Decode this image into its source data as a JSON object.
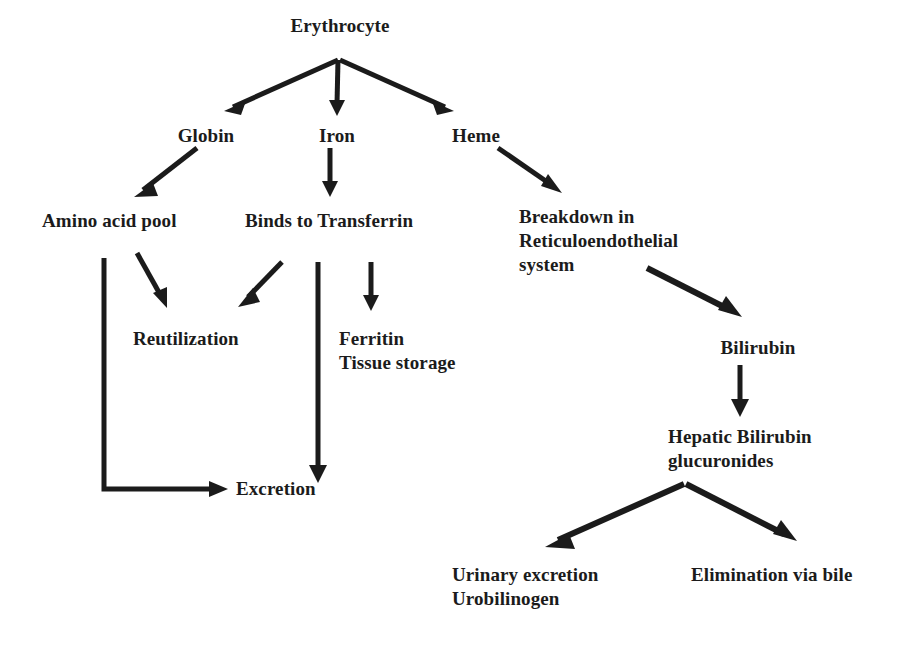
{
  "diagram": {
    "background_color": "#ffffff",
    "ink_color": "#1b1b1b",
    "nodes": [
      {
        "id": "erythrocyte",
        "label": "Erythrocyte",
        "x": 340,
        "y": 14,
        "align": "center"
      },
      {
        "id": "globin",
        "label": "Globin",
        "x": 206,
        "y": 124,
        "align": "center"
      },
      {
        "id": "iron",
        "label": "Iron",
        "x": 337,
        "y": 124,
        "align": "center"
      },
      {
        "id": "heme",
        "label": "Heme",
        "x": 476,
        "y": 124,
        "align": "center"
      },
      {
        "id": "amino-acid-pool",
        "label": "Amino acid pool",
        "x": 42,
        "y": 209,
        "align": "left"
      },
      {
        "id": "binds-to-transferrin",
        "label": "Binds to Transferrin",
        "x": 245,
        "y": 209,
        "align": "left"
      },
      {
        "id": "breakdown-res",
        "label": "Breakdown in\nReticuloendothelial\nsystem",
        "x": 519,
        "y": 205,
        "align": "left"
      },
      {
        "id": "reutilization",
        "label": "Reutilization",
        "x": 133,
        "y": 327,
        "align": "left"
      },
      {
        "id": "ferritin-tissue-storage",
        "label": "Ferritin\nTissue storage",
        "x": 339,
        "y": 327,
        "align": "left"
      },
      {
        "id": "bilirubin",
        "label": "Bilirubin",
        "x": 758,
        "y": 336,
        "align": "center"
      },
      {
        "id": "excretion",
        "label": "Excretion",
        "x": 236,
        "y": 477,
        "align": "left"
      },
      {
        "id": "hepatic-bilirubin-glucuronides",
        "label": "Hepatic Bilirubin\nglucuronides",
        "x": 668,
        "y": 425,
        "align": "left"
      },
      {
        "id": "urinary-excretion-urobilinogen",
        "label": "Urinary excretion\nUrobilinogen",
        "x": 452,
        "y": 563,
        "align": "left"
      },
      {
        "id": "elimination-via-bile",
        "label": "Elimination via bile",
        "x": 691,
        "y": 563,
        "align": "left"
      }
    ],
    "edges": [
      {
        "id": "erythrocyte-to-globin",
        "from": "erythrocyte",
        "to": "globin",
        "kind": "arrow"
      },
      {
        "id": "erythrocyte-to-iron",
        "from": "erythrocyte",
        "to": "iron",
        "kind": "arrow"
      },
      {
        "id": "erythrocyte-to-heme",
        "from": "erythrocyte",
        "to": "heme",
        "kind": "arrow"
      },
      {
        "id": "globin-to-amino-acid-pool",
        "from": "globin",
        "to": "amino-acid-pool",
        "kind": "arrow"
      },
      {
        "id": "iron-to-binds-to-transferrin",
        "from": "iron",
        "to": "binds-to-transferrin",
        "kind": "arrow"
      },
      {
        "id": "heme-to-breakdown-res",
        "from": "heme",
        "to": "breakdown-res",
        "kind": "arrow"
      },
      {
        "id": "amino-acid-pool-to-reutilization",
        "from": "amino-acid-pool",
        "to": "reutilization",
        "kind": "arrow"
      },
      {
        "id": "transferrin-to-reutilization",
        "from": "binds-to-transferrin",
        "to": "reutilization",
        "kind": "arrow"
      },
      {
        "id": "transferrin-to-ferritin",
        "from": "binds-to-transferrin",
        "to": "ferritin-tissue-storage",
        "kind": "arrow"
      },
      {
        "id": "amino-acid-pool-to-excretion",
        "from": "amino-acid-pool",
        "to": "excretion",
        "kind": "elbow-arrow"
      },
      {
        "id": "transferrin-to-excretion",
        "from": "binds-to-transferrin",
        "to": "excretion",
        "kind": "arrow"
      },
      {
        "id": "breakdown-res-to-bilirubin",
        "from": "breakdown-res",
        "to": "bilirubin",
        "kind": "arrow"
      },
      {
        "id": "bilirubin-to-hepatic-glucuronides",
        "from": "bilirubin",
        "to": "hepatic-bilirubin-glucuronides",
        "kind": "arrow"
      },
      {
        "id": "glucuronides-to-urinary-excretion",
        "from": "hepatic-bilirubin-glucuronides",
        "to": "urinary-excretion-urobilinogen",
        "kind": "arrow"
      },
      {
        "id": "glucuronides-to-elimination-via-bile",
        "from": "hepatic-bilirubin-glucuronides",
        "to": "elimination-via-bile",
        "kind": "arrow"
      }
    ]
  }
}
